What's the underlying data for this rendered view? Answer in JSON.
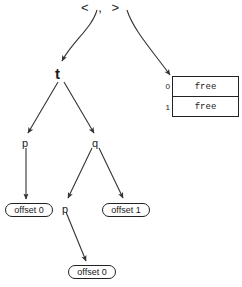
{
  "diagram": {
    "root": {
      "name": "tuple-root",
      "label": "<  ,  >",
      "open_bracket": "<",
      "separator": ",",
      "close_bracket": ">"
    },
    "nodes": [
      {
        "id": "t",
        "label": "t",
        "kind": "bound-variable",
        "bold": true,
        "x": 55,
        "y": 66
      },
      {
        "id": "p-left",
        "label": "p",
        "kind": "variable",
        "bold": false,
        "x": 22,
        "y": 138
      },
      {
        "id": "q",
        "label": "q",
        "kind": "variable",
        "bold": false,
        "x": 92,
        "y": 138
      },
      {
        "id": "p-mid",
        "label": "p",
        "kind": "variable",
        "bold": false,
        "x": 62,
        "y": 204
      }
    ],
    "leaves": [
      {
        "id": "offset-0-left",
        "label": "offset 0",
        "x": 5,
        "y": 203,
        "w": 48
      },
      {
        "id": "offset-1-right",
        "label": "offset 1",
        "x": 102,
        "y": 203,
        "w": 48
      },
      {
        "id": "offset-0-bottom",
        "label": "offset 0",
        "x": 68,
        "y": 265,
        "w": 48
      }
    ],
    "memory": {
      "name": "free-cell-table",
      "x": 172,
      "y": 76,
      "rows": [
        {
          "index": "0",
          "value": "free"
        },
        {
          "index": "1",
          "value": "free"
        }
      ]
    },
    "edges": [
      {
        "from": "tuple-root-left",
        "to": "t",
        "style": "curve"
      },
      {
        "from": "tuple-root-right",
        "to": "free-cell-table",
        "style": "curve"
      },
      {
        "from": "t",
        "to": "p-left",
        "style": "line"
      },
      {
        "from": "t",
        "to": "q",
        "style": "line"
      },
      {
        "from": "p-left",
        "to": "offset-0-left",
        "style": "line"
      },
      {
        "from": "q",
        "to": "p-mid",
        "style": "line"
      },
      {
        "from": "q",
        "to": "offset-1-right",
        "style": "line"
      },
      {
        "from": "p-mid",
        "to": "offset-0-bottom",
        "style": "line"
      }
    ],
    "colors": {
      "stroke": "#333333",
      "text": "#1a1a1a",
      "background": "#ffffff"
    }
  }
}
